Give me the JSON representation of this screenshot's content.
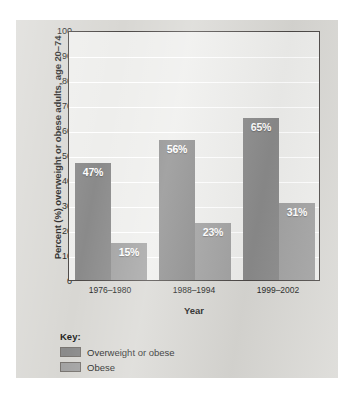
{
  "chart_data": {
    "type": "bar",
    "title": "",
    "xlabel": "Year",
    "ylabel": "Percent (%) overweight or obese adults, age 20–74",
    "categories": [
      "1976–1980",
      "1988–1994",
      "1999–2002"
    ],
    "series": [
      {
        "name": "Overweight or obese",
        "color": "#8a8a8a",
        "values": [
          47,
          56,
          65
        ],
        "labels": [
          "47%",
          "56%",
          "65%"
        ]
      },
      {
        "name": "Obese",
        "color": "#a0a0a0",
        "values": [
          15,
          23,
          31
        ],
        "labels": [
          "15%",
          "23%",
          "31%"
        ]
      }
    ],
    "ylim": [
      0,
      100
    ],
    "ytick_values": [
      0,
      10,
      20,
      30,
      40,
      50,
      60,
      70,
      80,
      90,
      100
    ],
    "ytick_labels": [
      "0",
      "10",
      "20",
      "30",
      "40",
      "50",
      "60",
      "70",
      "80",
      "90",
      "100"
    ],
    "grid": true,
    "legend_position": "below-plot-left",
    "legend_title": "Key:"
  },
  "colors": {
    "card_background": "#d8d7d3",
    "plot_background": "#eeeeec",
    "plot_border": "#4b4745",
    "gridline": "#ffffff",
    "series_overweight_or_obese": "#8a8a8a",
    "series_obese": "#a0a0a0",
    "text": "#231f1e",
    "bar_label_text": "#ffffff"
  }
}
